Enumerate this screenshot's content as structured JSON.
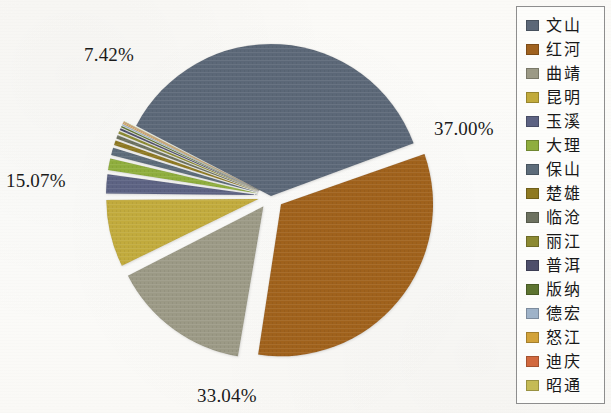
{
  "chart_data": {
    "type": "pie",
    "title": "",
    "xlabel": "",
    "ylabel": "",
    "legend_position": "right",
    "grid": false,
    "categories": [
      "文山",
      "红河",
      "曲靖",
      "昆明",
      "玉溪",
      "大理",
      "保山",
      "楚雄",
      "临沧",
      "丽江",
      "普洱",
      "版纳",
      "德宏",
      "怒江",
      "迪庆",
      "昭通"
    ],
    "values": [
      37.0,
      33.04,
      15.07,
      7.42,
      2.3,
      1.5,
      1.05,
      0.7,
      0.52,
      0.4,
      0.3,
      0.22,
      0.18,
      0.12,
      0.1,
      0.08
    ],
    "unit": "%",
    "visible_labels": [
      "37.00%",
      "33.04%",
      "15.07%",
      "7.42%"
    ],
    "colors": [
      "#5c6878",
      "#a0621f",
      "#9c9a86",
      "#c2ab3c",
      "#5d6383",
      "#8fae3e",
      "#5d6c7a",
      "#8f7a22",
      "#6d7260",
      "#8c8a32",
      "#4e4f6b",
      "#5d7430",
      "#9fb3c9",
      "#d3a33a",
      "#d2693e",
      "#c5bb55"
    ],
    "exploded": [
      false,
      true,
      true,
      true,
      true,
      true,
      true,
      true,
      true,
      true,
      true,
      true,
      true,
      true,
      true,
      true
    ]
  },
  "legend": {
    "items": [
      {
        "label": "文山",
        "color": "#5c6878"
      },
      {
        "label": "红河",
        "color": "#a0621f"
      },
      {
        "label": "曲靖",
        "color": "#9c9a86"
      },
      {
        "label": "昆明",
        "color": "#c2ab3c"
      },
      {
        "label": "玉溪",
        "color": "#5d6383"
      },
      {
        "label": "大理",
        "color": "#8fae3e"
      },
      {
        "label": "保山",
        "color": "#5d6c7a"
      },
      {
        "label": "楚雄",
        "color": "#8f7a22"
      },
      {
        "label": "临沧",
        "color": "#6d7260"
      },
      {
        "label": "丽江",
        "color": "#8c8a32"
      },
      {
        "label": "普洱",
        "color": "#4e4f6b"
      },
      {
        "label": "版纳",
        "color": "#5d7430"
      },
      {
        "label": "德宏",
        "color": "#9fb3c9"
      },
      {
        "label": "怒江",
        "color": "#d3a33a"
      },
      {
        "label": "迪庆",
        "color": "#d2693e"
      },
      {
        "label": "昭通",
        "color": "#c5bb55"
      }
    ]
  },
  "labels": {
    "pct_0": "37.00%",
    "pct_1": "33.04%",
    "pct_2": "15.07%",
    "pct_3": "7.42%"
  }
}
